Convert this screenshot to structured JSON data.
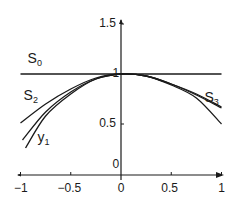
{
  "chart_data": {
    "type": "line",
    "title": "",
    "xlabel": "",
    "ylabel": "",
    "xlim": [
      -1,
      1
    ],
    "ylim": [
      0,
      1.5
    ],
    "grid": false,
    "legend": "inline labels",
    "x_ticks": [
      {
        "value": -1,
        "label": "-1"
      },
      {
        "value": -0.5,
        "label": "-0.5"
      },
      {
        "value": 0,
        "label": "0"
      },
      {
        "value": 0.5,
        "label": "0.5"
      },
      {
        "value": 1,
        "label": "1"
      }
    ],
    "y_ticks": [
      {
        "value": 0,
        "label": "0"
      },
      {
        "value": 0.5,
        "label": "0.5"
      },
      {
        "value": 1,
        "label": "1"
      },
      {
        "value": 1.5,
        "label": "1.5"
      }
    ],
    "series": [
      {
        "name": "S0",
        "x": [
          -1,
          1
        ],
        "y": [
          1,
          1
        ]
      },
      {
        "name": "S2",
        "x": [
          -1,
          -0.75,
          -0.5,
          -0.25,
          0,
          0.25,
          0.5,
          0.75,
          1
        ],
        "y": [
          0.51,
          0.7,
          0.85,
          0.96,
          1.0,
          0.98,
          0.9,
          0.79,
          0.66
        ]
      },
      {
        "name": "S3",
        "x": [
          -0.98,
          -0.75,
          -0.5,
          -0.25,
          0,
          0.25,
          0.5,
          0.75,
          1
        ],
        "y": [
          0.34,
          0.62,
          0.82,
          0.95,
          1.0,
          0.98,
          0.9,
          0.8,
          0.67
        ]
      },
      {
        "name": "y1",
        "x": [
          -0.95,
          -0.75,
          -0.5,
          -0.25,
          0,
          0.25,
          0.5,
          0.75,
          1
        ],
        "y": [
          0.26,
          0.58,
          0.8,
          0.95,
          1.0,
          0.98,
          0.89,
          0.76,
          0.5
        ]
      }
    ],
    "annotations": [
      {
        "text": "S",
        "sub": "0",
        "x": -0.88,
        "y": 1.15
      },
      {
        "text": "S",
        "sub": "2",
        "x": -0.92,
        "y": 0.78
      },
      {
        "text": "S",
        "sub": "3",
        "x": 0.88,
        "y": 0.76
      },
      {
        "text": "y",
        "sub": "1",
        "x": -0.78,
        "y": 0.36
      }
    ]
  }
}
